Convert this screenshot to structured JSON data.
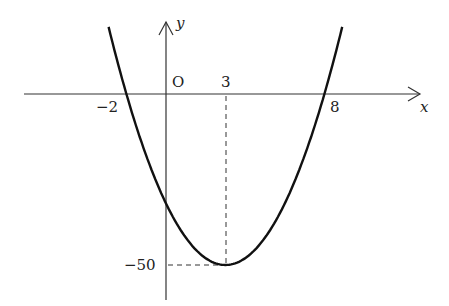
{
  "chart_data": {
    "type": "line",
    "title": "",
    "function": "y = 2(x+2)(x-8) = 2x^2 - 12x - 32",
    "xlabel": "x",
    "ylabel": "y",
    "origin_label": "O",
    "x_ticks": [
      {
        "value": -2,
        "label": "-2"
      },
      {
        "value": 3,
        "label": "3"
      },
      {
        "value": 8,
        "label": "8"
      }
    ],
    "y_ticks": [
      {
        "value": -50,
        "label": "-50"
      }
    ],
    "key_points": {
      "roots": [
        -2,
        8
      ],
      "vertex": {
        "x": 3,
        "y": -50
      },
      "y_intercept": -32
    },
    "series": [
      {
        "name": "parabola",
        "x": [
          -2.9,
          -2,
          -1,
          0,
          1,
          2,
          3,
          4,
          5,
          6,
          7,
          8,
          8.9
        ],
        "values": [
          21.6,
          0,
          -18,
          -32,
          -42,
          -48,
          -50,
          -48,
          -42,
          -32,
          -18,
          0,
          21.6
        ]
      }
    ],
    "guides": [
      "dashed vertical line x=3 from axis to vertex",
      "dashed horizontal line y=-50 from y-axis to vertex"
    ],
    "grid": false,
    "legend": "none"
  },
  "labels": {
    "x_axis": "x",
    "y_axis": "y",
    "origin": "O",
    "tick_neg2": "−2",
    "tick_3": "3",
    "tick_8": "8",
    "tick_neg50": "−50"
  }
}
